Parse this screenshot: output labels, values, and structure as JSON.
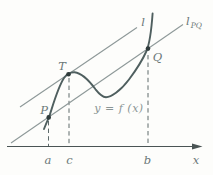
{
  "labels": {
    "point_p": "P",
    "point_t": "T",
    "point_q": "Q",
    "tangent_line": "l",
    "secant_line_main": "l",
    "secant_line_sub": "PQ",
    "curve_equation": "y = f (x)",
    "axis_x": "x",
    "tick_a": "a",
    "tick_c": "c",
    "tick_b": "b"
  },
  "colors": {
    "background": "#fdfdfb",
    "curve": "#4f5f5f",
    "point_dot": "#2f3b3b",
    "straight_line": "#8d9898",
    "dashed_line": "#5f6b6b",
    "axis": "#4a5454",
    "label_text": "#6b7878",
    "curve_label_text": "#8a9595"
  }
}
